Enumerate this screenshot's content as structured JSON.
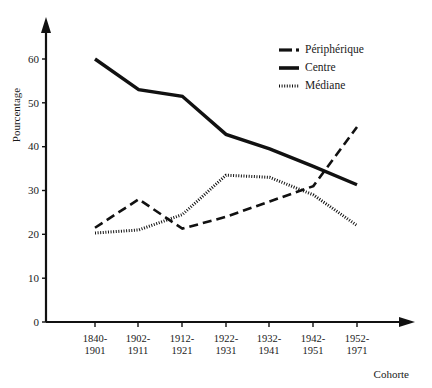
{
  "chart_data": {
    "type": "line",
    "title": "",
    "subtitle": "",
    "xlabel": "Cohorte",
    "ylabel": "Pourcentage",
    "categories": [
      "1840-1901",
      "1902-1911",
      "1912-1921",
      "1922-1931",
      "1932-1941",
      "1942-1951",
      "1952-1971"
    ],
    "category_lines": [
      [
        "1840-",
        "1901"
      ],
      [
        "1902-",
        "1911"
      ],
      [
        "1912-",
        "1921"
      ],
      [
        "1922-",
        "1931"
      ],
      [
        "1932-",
        "1941"
      ],
      [
        "1942-",
        "1951"
      ],
      [
        "1952-",
        "1971"
      ]
    ],
    "series": [
      {
        "name": "Périphérique",
        "style": "dash-dot",
        "color": "#111111",
        "values": [
          21.5,
          28.0,
          21.3,
          24.0,
          27.5,
          31.0,
          44.5
        ]
      },
      {
        "name": "Centre",
        "style": "solid",
        "color": "#111111",
        "values": [
          60.0,
          53.0,
          51.5,
          42.8,
          39.5,
          35.5,
          31.3
        ]
      },
      {
        "name": "Médiane",
        "style": "dotted",
        "color": "#111111",
        "values": [
          20.3,
          21.0,
          24.5,
          33.5,
          33.0,
          29.0,
          22.0
        ]
      }
    ],
    "ylim": [
      0,
      67
    ],
    "yticks": [
      0,
      10,
      20,
      30,
      40,
      50,
      60
    ],
    "ytick_labels": [
      "0",
      "10",
      "20",
      "30",
      "40",
      "50",
      "60"
    ],
    "grid": false,
    "legend_position": "top-right",
    "axis_arrows": true
  },
  "legend": {
    "items": [
      {
        "label": "Périphérique",
        "marker": "dash-dot-marker"
      },
      {
        "label": "Centre",
        "marker": "solid-marker"
      },
      {
        "label": "Médiane",
        "marker": "dotted-marker"
      }
    ]
  }
}
